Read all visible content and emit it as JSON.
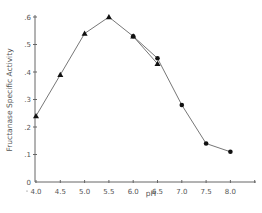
{
  "chart_data": {
    "type": "line",
    "title": "",
    "xlabel": "pH",
    "ylabel": "Fructanase Specific Activity",
    "xlim": [
      4.0,
      8.5
    ],
    "ylim": [
      0,
      0.6
    ],
    "x_ticks": [
      "4.0",
      "4.5",
      "5.0",
      "5.5",
      "6.0",
      "6.5",
      "7.0",
      "7.5",
      "8.0"
    ],
    "y_ticks": [
      "0",
      ".1",
      ".2",
      ".3",
      ".4",
      ".5",
      ".6"
    ],
    "grid": false,
    "legend": null,
    "series": [
      {
        "name": "triangle-series",
        "marker": "triangle",
        "x": [
          4.0,
          4.5,
          5.0,
          5.5,
          6.0,
          6.5
        ],
        "values": [
          0.24,
          0.39,
          0.54,
          0.6,
          0.53,
          0.43
        ]
      },
      {
        "name": "circle-series",
        "marker": "circle",
        "x": [
          6.0,
          6.5,
          7.0,
          7.5,
          8.0
        ],
        "values": [
          0.53,
          0.45,
          0.28,
          0.14,
          0.11
        ]
      }
    ]
  },
  "colors": {
    "line": "#777777",
    "marker": "#111111",
    "axis": "#666666",
    "text": "#555555"
  }
}
